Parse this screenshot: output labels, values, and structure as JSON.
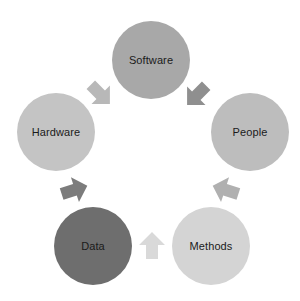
{
  "diagram": {
    "type": "cycle",
    "title": "",
    "background_color": "#ffffff",
    "label_color": "#1b1b1b",
    "nodes": [
      {
        "id": "software",
        "label": "Software",
        "color": "#a8a8a8",
        "cx": 151,
        "cy": 60,
        "r": 39
      },
      {
        "id": "people",
        "label": "People",
        "color": "#bdbdbd",
        "cx": 250,
        "cy": 132,
        "r": 39
      },
      {
        "id": "methods",
        "label": "Methods",
        "color": "#d4d4d4",
        "cx": 211,
        "cy": 246,
        "r": 39
      },
      {
        "id": "data",
        "label": "Data",
        "color": "#6e6e6e",
        "cx": 93,
        "cy": 246,
        "r": 39
      },
      {
        "id": "hardware",
        "label": "Hardware",
        "color": "#c4c4c4",
        "cx": 56,
        "cy": 132,
        "r": 39
      }
    ],
    "arrows": [
      {
        "id": "arrow-software-to-people",
        "from": "software",
        "to": "people",
        "color": "#8f8f8f",
        "cx": 197,
        "cy": 95,
        "rotation": 135
      },
      {
        "id": "arrow-people-to-methods",
        "from": "people",
        "to": "methods",
        "color": "#b0b0b0",
        "cx": 226,
        "cy": 190,
        "rotation": 198
      },
      {
        "id": "arrow-methods-to-data",
        "from": "methods",
        "to": "data",
        "color": "#d9d9d9",
        "cx": 152,
        "cy": 246,
        "rotation": 270
      },
      {
        "id": "arrow-data-to-hardware",
        "from": "data",
        "to": "hardware",
        "color": "#7c7c7c",
        "cx": 74,
        "cy": 190,
        "rotation": 342
      },
      {
        "id": "arrow-hardware-to-software",
        "from": "hardware",
        "to": "software",
        "color": "#b8b8b8",
        "cx": 100,
        "cy": 94,
        "rotation": 45
      }
    ]
  }
}
